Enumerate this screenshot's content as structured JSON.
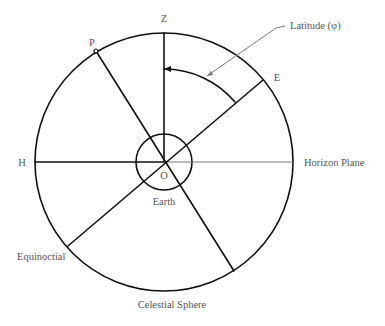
{
  "diagram": {
    "labels": {
      "zenith": "Z",
      "pole": "P",
      "east": "E",
      "horizon_point": "H",
      "origin": "O",
      "earth": "Earth",
      "horizon_plane": "Horizon Plane",
      "equinoctial": "Equinoctial",
      "celestial_sphere": "Celestial Sphere",
      "latitude": "Latitude (φ)"
    },
    "colors": {
      "line": "#111111",
      "leader": "#777777",
      "text": "#555555",
      "background": "#ffffff"
    }
  }
}
